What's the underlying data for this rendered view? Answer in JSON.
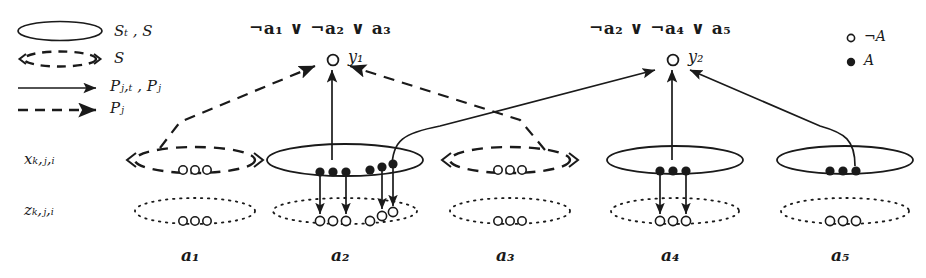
{
  "figure": {
    "legend": {
      "items": [
        {
          "icon": "solid-ellipse-icon",
          "label": "Sₜ , S"
        },
        {
          "icon": "dashed-ellipse-icon",
          "label": "S"
        },
        {
          "icon": "solid-arrow-icon",
          "label": "Pⱼ,ₜ , Pⱼ"
        },
        {
          "icon": "dashed-arrow-icon",
          "label": "Pⱼ"
        }
      ],
      "node_legend": [
        {
          "icon": "hollow-circle-icon",
          "label": "¬A"
        },
        {
          "icon": "filled-circle-icon",
          "label": "A"
        }
      ]
    },
    "clauses": [
      {
        "id": "clause-1",
        "text": "¬a₁ ∨ ¬a₂ ∨ a₃",
        "node_label": "y₁"
      },
      {
        "id": "clause-2",
        "text": "¬a₂ ∨ ¬a₄ ∨ a₅",
        "node_label": "y₂"
      }
    ],
    "row_labels": [
      {
        "id": "row-x",
        "text": "xₖ,ⱼ,ᵢ"
      },
      {
        "id": "row-z",
        "text": "zₖ,ⱼ,ᵢ"
      }
    ],
    "columns": [
      {
        "id": "col-a1",
        "label": "a₁",
        "x_style": "dashed",
        "x_dots": "hollow",
        "z_style": "dotted",
        "z_dots": "hollow"
      },
      {
        "id": "col-a2",
        "label": "a₂",
        "x_style": "solid",
        "x_dots": "filled",
        "z_style": "dotted",
        "z_dots": "hollow"
      },
      {
        "id": "col-a3",
        "label": "a₃",
        "x_style": "dashed",
        "x_dots": "hollow",
        "z_style": "dotted",
        "z_dots": "hollow"
      },
      {
        "id": "col-a4",
        "label": "a₄",
        "x_style": "solid",
        "x_dots": "filled",
        "z_style": "dotted",
        "z_dots": "hollow"
      },
      {
        "id": "col-a5",
        "label": "a₅",
        "x_style": "solid",
        "x_dots": "filled",
        "z_style": "dotted",
        "z_dots": "hollow"
      }
    ],
    "colors": {
      "ink": "#1a1a1a",
      "paper": "#ffffff"
    }
  }
}
